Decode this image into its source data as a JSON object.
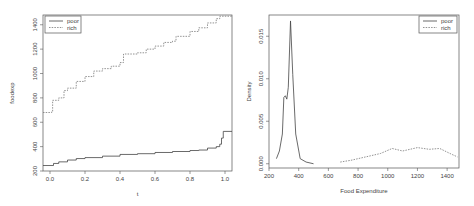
{
  "chart_data": [
    {
      "type": "line",
      "title": "",
      "xlabel": "t",
      "ylabel": "foodexp",
      "xlim": [
        -0.04,
        1.04
      ],
      "ylim": [
        200,
        1480
      ],
      "xticks": [
        "0.0",
        "0.2",
        "0.4",
        "0.6",
        "0.8",
        "1.0"
      ],
      "yticks": [
        "200",
        "400",
        "600",
        "800",
        "1000",
        "1200",
        "1400"
      ],
      "legend": {
        "position": "topleft",
        "entries": [
          "poor",
          "rich"
        ]
      },
      "series": [
        {
          "name": "poor",
          "style": "solid",
          "x": [
            -0.04,
            0.0,
            0.02,
            0.05,
            0.1,
            0.15,
            0.2,
            0.3,
            0.4,
            0.5,
            0.6,
            0.7,
            0.8,
            0.85,
            0.9,
            0.95,
            0.97,
            0.98,
            0.99,
            1.04
          ],
          "y": [
            245,
            245,
            262,
            275,
            290,
            302,
            310,
            322,
            336,
            342,
            352,
            360,
            368,
            372,
            388,
            400,
            420,
            470,
            525,
            525
          ]
        },
        {
          "name": "rich",
          "style": "dashed",
          "x": [
            -0.04,
            0.0,
            0.01,
            0.015,
            0.05,
            0.08,
            0.1,
            0.15,
            0.2,
            0.25,
            0.3,
            0.35,
            0.4,
            0.42,
            0.5,
            0.55,
            0.6,
            0.65,
            0.7,
            0.72,
            0.8,
            0.85,
            0.9,
            0.95,
            0.97,
            1.04
          ],
          "y": [
            680,
            680,
            690,
            780,
            800,
            860,
            880,
            935,
            975,
            1020,
            1040,
            1060,
            1090,
            1160,
            1170,
            1200,
            1225,
            1255,
            1265,
            1305,
            1345,
            1375,
            1415,
            1450,
            1470,
            1470
          ]
        }
      ]
    },
    {
      "type": "line",
      "title": "",
      "xlabel": "Food Expenditure",
      "ylabel": "Density",
      "xlim": [
        200,
        1480
      ],
      "ylim": [
        -0.0005,
        0.0175
      ],
      "xticks": [
        "200",
        "400",
        "600",
        "800",
        "1000",
        "1200",
        "1400"
      ],
      "yticks": [
        "0.000",
        "0.005",
        "0.010",
        "0.015"
      ],
      "legend": {
        "position": "topright",
        "entries": [
          "poor",
          "rich"
        ]
      },
      "series": [
        {
          "name": "poor",
          "style": "solid",
          "x": [
            250,
            270,
            290,
            300,
            310,
            320,
            330,
            345,
            360,
            380,
            410,
            450,
            500
          ],
          "y": [
            0.0006,
            0.0015,
            0.0035,
            0.0078,
            0.008,
            0.0076,
            0.009,
            0.0168,
            0.0105,
            0.0035,
            0.0006,
            0.0002,
            0.0
          ]
        },
        {
          "name": "rich",
          "style": "dashed",
          "x": [
            680,
            750,
            850,
            950,
            1030,
            1100,
            1200,
            1280,
            1350,
            1420,
            1470
          ],
          "y": [
            0.0002,
            0.0004,
            0.0008,
            0.0012,
            0.0018,
            0.0015,
            0.0019,
            0.0017,
            0.0018,
            0.0012,
            0.0008
          ]
        }
      ]
    }
  ]
}
